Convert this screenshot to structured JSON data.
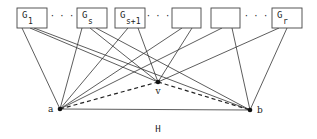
{
  "diagram": {
    "caption": "H",
    "boxes": [
      {
        "id": "G1",
        "main": "G",
        "sub": "1",
        "x": 17,
        "w": 30
      },
      {
        "id": "Gs",
        "main": "G",
        "sub": "s",
        "x": 77,
        "w": 30
      },
      {
        "id": "Gs1",
        "main": "G",
        "sub": "s+1",
        "x": 115,
        "w": 30
      },
      {
        "id": "blank1",
        "main": "",
        "sub": "",
        "x": 172,
        "w": 29
      },
      {
        "id": "blank2",
        "main": "",
        "sub": "",
        "x": 211,
        "w": 29
      },
      {
        "id": "Gr",
        "main": "G",
        "sub": "r",
        "x": 272,
        "w": 30
      }
    ],
    "ellipses": [
      {
        "text": "· · ·",
        "x": 62
      },
      {
        "text": "· · ·",
        "x": 158
      },
      {
        "text": "· · ·",
        "x": 256
      }
    ],
    "vertices": {
      "a": {
        "label": "a",
        "x": 60,
        "y": 109
      },
      "v": {
        "label": "v",
        "x": 158,
        "y": 82
      },
      "b": {
        "label": "b",
        "x": 250,
        "y": 110
      }
    },
    "edges_solid": [
      [
        22,
        28,
        60,
        109
      ],
      [
        30,
        28,
        158,
        82
      ],
      [
        34,
        28,
        250,
        110
      ],
      [
        82,
        28,
        60,
        109
      ],
      [
        90,
        28,
        158,
        82
      ],
      [
        96,
        28,
        250,
        110
      ],
      [
        128,
        28,
        60,
        109
      ],
      [
        138,
        28,
        158,
        82
      ],
      [
        182,
        28,
        60,
        109
      ],
      [
        192,
        28,
        158,
        82
      ],
      [
        222,
        28,
        60,
        109
      ],
      [
        232,
        28,
        250,
        110
      ],
      [
        279,
        28,
        158,
        82
      ],
      [
        287,
        28,
        250,
        110
      ],
      [
        60,
        109,
        250,
        110
      ]
    ],
    "edges_dashed": [
      [
        60,
        109,
        158,
        82
      ],
      [
        158,
        82,
        250,
        110
      ]
    ]
  }
}
